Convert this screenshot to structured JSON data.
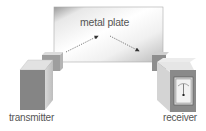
{
  "diagram": {
    "title": "",
    "labels": {
      "plate": "metal plate",
      "transmitter": "transmitter",
      "receiver": "receiver"
    },
    "components": [
      {
        "id": "metal-plate",
        "label": "metal plate"
      },
      {
        "id": "transmitter",
        "label": "transmitter"
      },
      {
        "id": "receiver",
        "label": "receiver",
        "has_meter": true
      }
    ],
    "arrows": [
      {
        "from": "transmitter",
        "to": "metal-plate",
        "style": "dotted"
      },
      {
        "from": "metal-plate",
        "to": "receiver",
        "style": "dotted"
      }
    ],
    "colors": {
      "plate_light": "#f4f4f4",
      "plate_dark": "#b8b8b8",
      "box_front": "#8a8a8a",
      "box_side": "#c8c8c8",
      "box_top": "#e0e0e0",
      "text": "#555555"
    }
  }
}
